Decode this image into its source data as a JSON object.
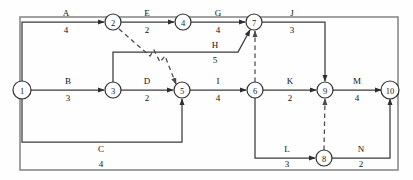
{
  "diagram": {
    "type": "activity-on-arrow-network",
    "title": "",
    "frame": {
      "x": 20,
      "y": 17,
      "width": 378,
      "height": 153,
      "color": "#8a8a8a"
    },
    "nodes": [
      {
        "id": "1",
        "label": "1",
        "x": 22,
        "y": 90,
        "r": 9
      },
      {
        "id": "2",
        "label": "2",
        "x": 113,
        "y": 22,
        "r": 8
      },
      {
        "id": "3",
        "label": "3",
        "x": 113,
        "y": 90,
        "r": 8
      },
      {
        "id": "4",
        "label": "4",
        "x": 183,
        "y": 22,
        "r": 8
      },
      {
        "id": "5",
        "label": "5",
        "x": 182,
        "y": 90,
        "r": 8
      },
      {
        "id": "6",
        "label": "6",
        "x": 255,
        "y": 90,
        "r": 8
      },
      {
        "id": "7",
        "label": "7",
        "x": 254,
        "y": 22,
        "r": 8
      },
      {
        "id": "8",
        "label": "8",
        "x": 324,
        "y": 158,
        "r": 8
      },
      {
        "id": "9",
        "label": "9",
        "x": 325,
        "y": 90,
        "r": 8
      },
      {
        "id": "10",
        "label": "10",
        "x": 390,
        "y": 90,
        "r": 9
      }
    ],
    "edges": [
      {
        "name": "A",
        "duration": "4",
        "from": "1",
        "to": "2",
        "path": "M 22 81 L 22 22 L 104 22",
        "label_x": 66,
        "name_y": 16,
        "dur_y": 33,
        "dashed": false
      },
      {
        "name": "B",
        "duration": "3",
        "from": "1",
        "to": "3",
        "path": "M 31 90 L 104 90",
        "label_x": 68,
        "name_y": 84,
        "dur_y": 101,
        "dashed": false
      },
      {
        "name": "C",
        "duration": "4",
        "from": "1",
        "to": "5",
        "path": "M 22 99 L 22 142 L 182 142 L 182 99",
        "label_x": 101,
        "name_y": 152,
        "dur_y": 167,
        "dashed": false
      },
      {
        "name": "D",
        "duration": "2",
        "from": "3",
        "to": "5",
        "path": "M 121 90 L 173 90",
        "label_x": 147,
        "name_y": 84,
        "dur_y": 101,
        "dashed": false
      },
      {
        "name": "E",
        "duration": "2",
        "from": "2",
        "to": "4",
        "path": "M 121 22 L 174 22",
        "label_x": 147,
        "name_y": 16,
        "dur_y": 33,
        "dashed": false
      },
      {
        "name": "G",
        "duration": "4",
        "from": "4",
        "to": "7",
        "path": "M 191 22 L 245 22",
        "label_x": 218,
        "name_y": 16,
        "dur_y": 33,
        "dashed": false
      },
      {
        "name": "H",
        "duration": "5",
        "from": "3",
        "to": "7",
        "path": "M 113 82 L 113 52 L 238 52 L 250 30",
        "label_x": 215,
        "name_y": 48,
        "dur_y": 63,
        "dashed": false
      },
      {
        "name": "I",
        "duration": "4",
        "from": "5",
        "to": "6",
        "path": "M 190 90 L 246 90",
        "label_x": 218,
        "name_y": 84,
        "dur_y": 101,
        "dashed": false
      },
      {
        "name": "J",
        "duration": "3",
        "from": "7",
        "to": "9",
        "path": "M 262 22 L 325 22 L 325 81",
        "label_x": 292,
        "name_y": 16,
        "dur_y": 33,
        "dashed": false
      },
      {
        "name": "K",
        "duration": "2",
        "from": "6",
        "to": "9",
        "path": "M 263 90 L 316 90",
        "label_x": 290,
        "name_y": 84,
        "dur_y": 101,
        "dashed": false
      },
      {
        "name": "L",
        "duration": "3",
        "from": "6",
        "to": "8",
        "path": "M 255 98 L 255 158 L 315 158",
        "label_x": 287,
        "name_y": 152,
        "dur_y": 167,
        "dashed": false
      },
      {
        "name": "M",
        "duration": "4",
        "from": "9",
        "to": "10",
        "path": "M 333 90 L 381 90",
        "label_x": 357,
        "name_y": 84,
        "dur_y": 101,
        "dashed": false
      },
      {
        "name": "N",
        "duration": "2",
        "from": "8",
        "to": "10",
        "path": "M 332 158 L 390 158 L 390 99",
        "label_x": 361,
        "name_y": 152,
        "dur_y": 167,
        "dashed": false
      }
    ],
    "dummy_edges": [
      {
        "name": "",
        "from": "2",
        "to": "5",
        "path": "M 119 29 L 150 56 L 154 50 L 160 62 L 165 56 L 176 84"
      },
      {
        "name": "",
        "from": "6",
        "to": "7",
        "path": "M 255 82 L 255 31"
      },
      {
        "name": "",
        "from": "8",
        "to": "9",
        "path": "M 324 150 L 325 99"
      }
    ],
    "legend": {
      "solid_edge_meaning": "activity arrow with name and duration",
      "dashed_edge_meaning": "dummy activity"
    }
  },
  "chart_data": {
    "type": "diagram",
    "title": "",
    "nodes": [
      "1",
      "2",
      "3",
      "4",
      "5",
      "6",
      "7",
      "8",
      "9",
      "10"
    ],
    "activities": [
      {
        "name": "A",
        "from": 1,
        "to": 2,
        "duration": 4
      },
      {
        "name": "B",
        "from": 1,
        "to": 3,
        "duration": 3
      },
      {
        "name": "C",
        "from": 1,
        "to": 5,
        "duration": 4
      },
      {
        "name": "D",
        "from": 3,
        "to": 5,
        "duration": 2
      },
      {
        "name": "E",
        "from": 2,
        "to": 4,
        "duration": 2
      },
      {
        "name": "G",
        "from": 4,
        "to": 7,
        "duration": 4
      },
      {
        "name": "H",
        "from": 3,
        "to": 7,
        "duration": 5
      },
      {
        "name": "I",
        "from": 5,
        "to": 6,
        "duration": 4
      },
      {
        "name": "J",
        "from": 7,
        "to": 9,
        "duration": 3
      },
      {
        "name": "K",
        "from": 6,
        "to": 9,
        "duration": 2
      },
      {
        "name": "L",
        "from": 6,
        "to": 8,
        "duration": 3
      },
      {
        "name": "M",
        "from": 9,
        "to": 10,
        "duration": 4
      },
      {
        "name": "N",
        "from": 8,
        "to": 10,
        "duration": 2
      }
    ],
    "dummies": [
      {
        "from": 2,
        "to": 5
      },
      {
        "from": 6,
        "to": 7
      },
      {
        "from": 8,
        "to": 9
      }
    ]
  }
}
